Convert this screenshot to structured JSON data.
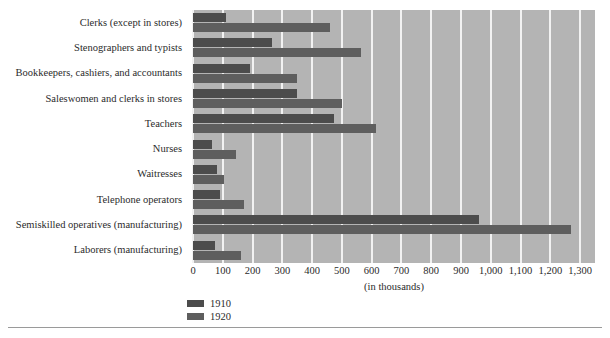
{
  "chart_data": {
    "type": "bar",
    "orientation": "horizontal",
    "title": "",
    "xlabel": "(in thousands)",
    "ylabel": "",
    "xlim": [
      0,
      1350
    ],
    "xticks": [
      "0",
      "100",
      "200",
      "300",
      "400",
      "500",
      "600",
      "700",
      "800",
      "900",
      "1,000",
      "1,100",
      "1,200",
      "1,300"
    ],
    "xtick_values": [
      0,
      100,
      200,
      300,
      400,
      500,
      600,
      700,
      800,
      900,
      1000,
      1100,
      1200,
      1300
    ],
    "grid": true,
    "legend_position": "bottom-left",
    "categories": [
      "Clerks (except in stores)",
      "Stenographers and typists",
      "Bookkeepers, cashiers, and accountants",
      "Saleswomen and clerks in stores",
      "Teachers",
      "Nurses",
      "Waitresses",
      "Telephone operators",
      "Semiskilled operatives (manufacturing)",
      "Laborers (manufacturing)"
    ],
    "series": [
      {
        "name": "1910",
        "color": "#4c4c4c",
        "values": [
          110,
          265,
          190,
          350,
          475,
          65,
          80,
          90,
          960,
          75
        ]
      },
      {
        "name": "1920",
        "color": "#5e5e5e",
        "values": [
          460,
          565,
          350,
          500,
          615,
          145,
          105,
          170,
          1270,
          160
        ]
      }
    ],
    "plot_background": "#b4b4b4",
    "gridline_color": "#f2f2f2"
  },
  "axis": {
    "title": "(in thousands)"
  },
  "legend": {
    "items": [
      {
        "label": "1910",
        "color": "#4c4c4c"
      },
      {
        "label": "1920",
        "color": "#5e5e5e"
      }
    ]
  }
}
